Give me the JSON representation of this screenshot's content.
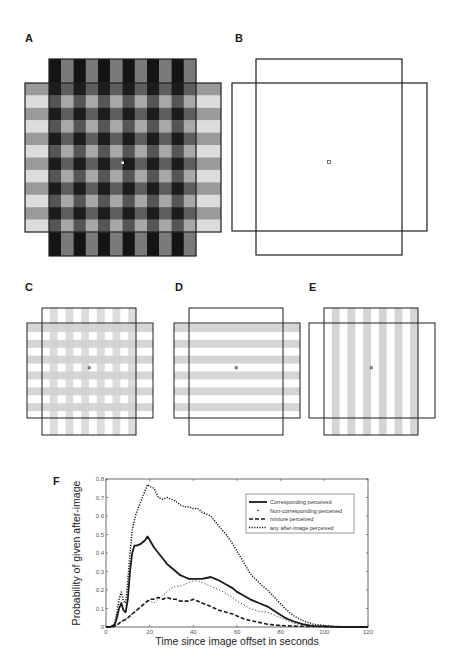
{
  "figure": {
    "panels": {
      "A": {
        "label": "A",
        "description": "Full-contrast overlapping gratings: dark vertical stripes on a vertical rectangle and light horizontal stripes on a horizontal rectangle, with central fixation dot"
      },
      "B": {
        "label": "B",
        "description": "Outline-only test display: two overlapping rectangle outlines with central fixation square"
      },
      "C": {
        "label": "C",
        "description": "Low-contrast plaid: both vertical and horizontal gray stripes inside rectangle outlines"
      },
      "D": {
        "label": "D",
        "description": "Horizontal gray stripes only (horizontal rectangle) with outlines"
      },
      "E": {
        "label": "E",
        "description": "Vertical gray stripes only (vertical rectangle) with outlines"
      },
      "F": {
        "label": "F"
      }
    },
    "colors": {
      "dark_stripe": "#141414",
      "mid_stripe": "#7a7a7a",
      "light_stripe": "#d6d6d6",
      "faint_stripe": "#d0d0d0",
      "outline": "#1e1e1e"
    }
  },
  "chart_data": {
    "type": "line",
    "title": "",
    "xlabel": "Time since image offset in seconds",
    "ylabel": "Probability of given after-image",
    "xlim": [
      0,
      120
    ],
    "ylim": [
      0,
      0.8
    ],
    "xticks": [
      "0",
      "20",
      "40",
      "60",
      "80",
      "100",
      "120"
    ],
    "yticks": [
      "0",
      "0.1",
      "0.2",
      "0.3",
      "0.4",
      "0.5",
      "0.6",
      "0.7",
      "0.8"
    ],
    "grid": false,
    "legend_position": "upper right",
    "x": [
      0,
      2,
      4,
      5,
      6,
      7,
      8,
      9,
      10,
      11,
      12,
      13,
      14,
      16,
      18,
      19,
      20,
      22,
      24,
      26,
      28,
      30,
      32,
      34,
      36,
      38,
      40,
      42,
      44,
      46,
      48,
      50,
      52,
      55,
      58,
      60,
      63,
      66,
      70,
      74,
      78,
      82,
      86,
      90,
      95,
      100,
      105,
      110,
      115,
      120
    ],
    "series": [
      {
        "name": "Corresponding perceived",
        "style": "solid",
        "values": [
          0,
          0,
          0.01,
          0.05,
          0.1,
          0.13,
          0.09,
          0.08,
          0.15,
          0.3,
          0.4,
          0.44,
          0.44,
          0.45,
          0.47,
          0.49,
          0.47,
          0.43,
          0.4,
          0.37,
          0.34,
          0.32,
          0.3,
          0.28,
          0.27,
          0.26,
          0.26,
          0.26,
          0.26,
          0.265,
          0.27,
          0.26,
          0.25,
          0.23,
          0.21,
          0.19,
          0.17,
          0.15,
          0.13,
          0.11,
          0.08,
          0.05,
          0.03,
          0.015,
          0.005,
          0.003,
          0.001,
          0,
          0,
          0
        ]
      },
      {
        "name": "Non-corresponding perceived",
        "style": "dotted-sparse",
        "values": [
          0,
          0,
          0.005,
          0.01,
          0.02,
          0.03,
          0.035,
          0.04,
          0.05,
          0.06,
          0.07,
          0.08,
          0.09,
          0.11,
          0.13,
          0.14,
          0.14,
          0.13,
          0.15,
          0.17,
          0.19,
          0.21,
          0.22,
          0.22,
          0.23,
          0.24,
          0.25,
          0.25,
          0.24,
          0.23,
          0.22,
          0.21,
          0.2,
          0.18,
          0.16,
          0.14,
          0.12,
          0.1,
          0.085,
          0.08,
          0.06,
          0.04,
          0.02,
          0.01,
          0.005,
          0.003,
          0.001,
          0,
          0,
          0
        ]
      },
      {
        "name": "mixture perceived",
        "style": "dashed",
        "values": [
          0,
          0,
          0.005,
          0.01,
          0.02,
          0.03,
          0.035,
          0.04,
          0.05,
          0.06,
          0.07,
          0.08,
          0.09,
          0.11,
          0.13,
          0.14,
          0.15,
          0.15,
          0.16,
          0.15,
          0.16,
          0.15,
          0.15,
          0.14,
          0.14,
          0.14,
          0.15,
          0.14,
          0.13,
          0.12,
          0.11,
          0.1,
          0.09,
          0.08,
          0.07,
          0.06,
          0.045,
          0.035,
          0.025,
          0.015,
          0.01,
          0.007,
          0.005,
          0.004,
          0.003,
          0.002,
          0.001,
          0,
          0,
          0
        ]
      },
      {
        "name": "any after-image perceived",
        "style": "dotted-dense",
        "values": [
          0,
          0,
          0.02,
          0.08,
          0.15,
          0.19,
          0.14,
          0.13,
          0.25,
          0.4,
          0.52,
          0.58,
          0.62,
          0.68,
          0.74,
          0.77,
          0.76,
          0.75,
          0.7,
          0.69,
          0.7,
          0.69,
          0.68,
          0.66,
          0.65,
          0.65,
          0.64,
          0.64,
          0.62,
          0.61,
          0.6,
          0.57,
          0.54,
          0.5,
          0.45,
          0.41,
          0.35,
          0.29,
          0.24,
          0.2,
          0.15,
          0.1,
          0.06,
          0.035,
          0.015,
          0.008,
          0.003,
          0.001,
          0,
          0
        ]
      }
    ]
  }
}
